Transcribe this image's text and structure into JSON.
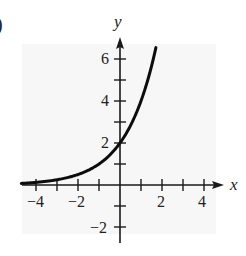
{
  "figure": {
    "panel_label_fragment": ")",
    "background_panel_color": "#f7f7f7",
    "axis_color": "#1a1a1a",
    "curve_color": "#0d0d0d"
  },
  "chart_data": {
    "type": "line",
    "title": "",
    "xlabel": "x",
    "ylabel": "y",
    "xlim": [
      -4.7,
      4.9
    ],
    "ylim": [
      -2.7,
      7.0
    ],
    "x_ticks": [
      -4,
      -3,
      -2,
      -1,
      1,
      2,
      3,
      4
    ],
    "x_tick_labels": [
      "-4",
      "-2",
      "2",
      "4"
    ],
    "x_tick_label_values": [
      -4,
      -2,
      2,
      4
    ],
    "y_ticks": [
      -2,
      -1,
      1,
      2,
      3,
      4,
      5,
      6
    ],
    "y_tick_labels": [
      "6",
      "4",
      "2",
      "-2"
    ],
    "y_tick_label_values": [
      6,
      4,
      2,
      -2
    ],
    "grid": false,
    "legend": null,
    "series": [
      {
        "name": "y = 2·2^x",
        "function": "2*2^x",
        "x": [
          -4.7,
          -4,
          -3,
          -2,
          -1,
          0,
          1,
          1.5,
          1.71
        ],
        "y": [
          0.08,
          0.125,
          0.25,
          0.5,
          1.0,
          2.0,
          4.0,
          5.66,
          6.54
        ]
      }
    ],
    "annotations": [
      {
        "text": "y-intercept",
        "x": 0,
        "y": 2
      }
    ]
  },
  "labels": {
    "x_axis": "x",
    "y_axis": "y",
    "x_ticks": [
      "−4",
      "−2",
      "2",
      "4"
    ],
    "y_ticks": [
      "6",
      "4",
      "2",
      "−2"
    ]
  }
}
